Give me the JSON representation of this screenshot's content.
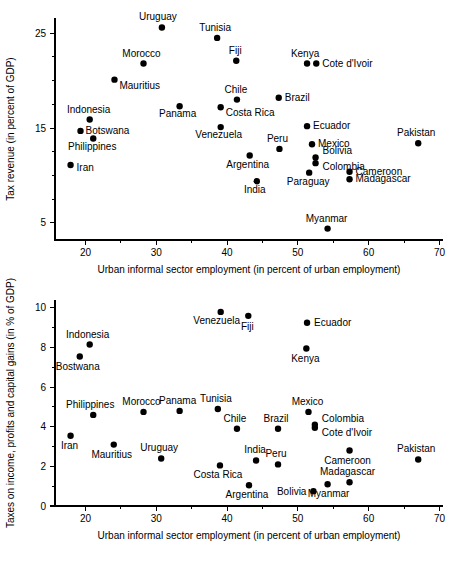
{
  "figure": {
    "background": "#ffffff",
    "ink": "#000000"
  },
  "chart_data": [
    {
      "id": "top",
      "type": "scatter",
      "title": "",
      "xlabel": "Urban informal sector employment (in percent of urban employment)",
      "ylabel": "Tax revenue (in percent of GDP)",
      "xlim": [
        15.7,
        70.5
      ],
      "ylim": [
        3.2,
        26.6
      ],
      "xticks": [
        20,
        30,
        40,
        50,
        60,
        70
      ],
      "xtick_labels": [
        "20",
        "30",
        "40",
        "50",
        "60",
        "70"
      ],
      "xminor_step": 5,
      "yticks": [
        5,
        15,
        25
      ],
      "ytick_labels": [
        "5",
        "15",
        "25"
      ],
      "yminor_step": 2.5,
      "grid": false,
      "legend": "none",
      "marker": "filled-circle",
      "points": [
        {
          "name": "Uruguay",
          "x": 30.8,
          "y": 25.6,
          "lx": -4,
          "ly": -7,
          "anchor": "middle"
        },
        {
          "name": "Tunisia",
          "x": 38.6,
          "y": 24.5,
          "lx": -2,
          "ly": -7,
          "anchor": "middle"
        },
        {
          "name": "Morocco",
          "x": 28.2,
          "y": 21.8,
          "lx": -2,
          "ly": -7,
          "anchor": "middle"
        },
        {
          "name": "Fiji",
          "x": 41.3,
          "y": 22.1,
          "lx": -1,
          "ly": -7,
          "anchor": "middle"
        },
        {
          "name": "Kenya",
          "x": 51.3,
          "y": 21.8,
          "lx": -2,
          "ly": -7,
          "anchor": "middle"
        },
        {
          "name": "Cote d'Ivoir",
          "x": 52.6,
          "y": 21.8,
          "lx": 6,
          "ly": 3,
          "anchor": "start"
        },
        {
          "name": "Mauritius",
          "x": 24.1,
          "y": 20.1,
          "lx": 5,
          "ly": 9,
          "anchor": "start"
        },
        {
          "name": "Chile",
          "x": 41.4,
          "y": 18.0,
          "lx": -1,
          "ly": -7,
          "anchor": "middle"
        },
        {
          "name": "Brazil",
          "x": 47.3,
          "y": 18.2,
          "lx": 6,
          "ly": 3,
          "anchor": "start"
        },
        {
          "name": "Costa Rica",
          "x": 39.1,
          "y": 17.2,
          "lx": 5,
          "ly": 9,
          "anchor": "start"
        },
        {
          "name": "Panama",
          "x": 33.3,
          "y": 17.3,
          "lx": -2,
          "ly": 11,
          "anchor": "middle"
        },
        {
          "name": "Indonesia",
          "x": 20.6,
          "y": 15.9,
          "lx": -1,
          "ly": -7,
          "anchor": "middle"
        },
        {
          "name": "Ecuador",
          "x": 51.3,
          "y": 15.2,
          "lx": 6,
          "ly": 3,
          "anchor": "start"
        },
        {
          "name": "Venezuela",
          "x": 39.1,
          "y": 15.1,
          "lx": -2,
          "ly": 11,
          "anchor": "middle"
        },
        {
          "name": "Botswana",
          "x": 19.3,
          "y": 14.7,
          "lx": 5,
          "ly": 3,
          "anchor": "start"
        },
        {
          "name": "Pakistan",
          "x": 67.0,
          "y": 13.4,
          "lx": -2,
          "ly": -7,
          "anchor": "middle"
        },
        {
          "name": "Philippines",
          "x": 21.1,
          "y": 13.9,
          "lx": -1,
          "ly": 12,
          "anchor": "middle"
        },
        {
          "name": "Mexico",
          "x": 52.0,
          "y": 13.3,
          "lx": 6,
          "ly": 3,
          "anchor": "start"
        },
        {
          "name": "Peru",
          "x": 47.4,
          "y": 12.8,
          "lx": -2,
          "ly": -7,
          "anchor": "middle"
        },
        {
          "name": "Bolivia",
          "x": 52.5,
          "y": 11.9,
          "lx": 7,
          "ly": -3,
          "anchor": "start"
        },
        {
          "name": "Colombia",
          "x": 52.5,
          "y": 11.3,
          "lx": 7,
          "ly": 7,
          "anchor": "start"
        },
        {
          "name": "Argentina",
          "x": 43.2,
          "y": 12.1,
          "lx": -2,
          "ly": 12,
          "anchor": "middle"
        },
        {
          "name": "Iran",
          "x": 17.9,
          "y": 11.1,
          "lx": 6,
          "ly": 6,
          "anchor": "start"
        },
        {
          "name": "Cameroon",
          "x": 57.3,
          "y": 10.4,
          "lx": 6,
          "ly": 3,
          "anchor": "start"
        },
        {
          "name": "Paraguay",
          "x": 51.6,
          "y": 10.3,
          "lx": -1,
          "ly": 12,
          "anchor": "middle"
        },
        {
          "name": "Madagascar",
          "x": 57.3,
          "y": 9.6,
          "lx": 6,
          "ly": 3,
          "anchor": "start"
        },
        {
          "name": "India",
          "x": 44.2,
          "y": 9.4,
          "lx": -2,
          "ly": 12,
          "anchor": "middle"
        },
        {
          "name": "Myanmar",
          "x": 54.2,
          "y": 4.4,
          "lx": -1,
          "ly": -7,
          "anchor": "middle"
        }
      ]
    },
    {
      "id": "bottom",
      "type": "scatter",
      "title": "",
      "xlabel": "Urban informal sector employment (in percent of urban employment)",
      "ylabel": "Taxes on income, profits and capital gains (in % of GDP)",
      "xlim": [
        15.7,
        70.5
      ],
      "ylim": [
        0,
        10.4
      ],
      "xticks": [
        20,
        30,
        40,
        50,
        60,
        70
      ],
      "xtick_labels": [
        "20",
        "30",
        "40",
        "50",
        "60",
        "70"
      ],
      "xminor_step": 5,
      "yticks": [
        0,
        2,
        4,
        6,
        8,
        10
      ],
      "ytick_labels": [
        "0",
        "2",
        "4",
        "6",
        "8",
        "10"
      ],
      "yminor_step": 1,
      "grid": false,
      "legend": "none",
      "marker": "filled-circle",
      "points": [
        {
          "name": "Venezuela",
          "x": 39.1,
          "y": 9.8,
          "lx": -4,
          "ly": 12,
          "anchor": "middle"
        },
        {
          "name": "Fiji",
          "x": 43.0,
          "y": 9.6,
          "lx": -1,
          "ly": 14,
          "anchor": "middle"
        },
        {
          "name": "Ecuador",
          "x": 51.3,
          "y": 9.25,
          "lx": 7,
          "ly": 3,
          "anchor": "start"
        },
        {
          "name": "Indonesia",
          "x": 20.6,
          "y": 8.15,
          "lx": -2,
          "ly": -7,
          "anchor": "middle"
        },
        {
          "name": "Kenya",
          "x": 51.2,
          "y": 7.95,
          "lx": -1,
          "ly": 13,
          "anchor": "middle"
        },
        {
          "name": "Bostwana",
          "x": 19.2,
          "y": 7.55,
          "lx": -2,
          "ly": 14,
          "anchor": "middle"
        },
        {
          "name": "Tunisia",
          "x": 38.7,
          "y": 4.9,
          "lx": -2,
          "ly": -7,
          "anchor": "middle"
        },
        {
          "name": "Panama",
          "x": 33.3,
          "y": 4.8,
          "lx": -2,
          "ly": -7,
          "anchor": "middle"
        },
        {
          "name": "Morocco",
          "x": 28.2,
          "y": 4.75,
          "lx": -2,
          "ly": -7,
          "anchor": "middle"
        },
        {
          "name": "Mexico",
          "x": 51.5,
          "y": 4.75,
          "lx": -1,
          "ly": -7,
          "anchor": "middle"
        },
        {
          "name": "Philippines",
          "x": 21.1,
          "y": 4.6,
          "lx": -3,
          "ly": -7,
          "anchor": "middle"
        },
        {
          "name": "Colombia",
          "x": 52.4,
          "y": 4.1,
          "lx": 7,
          "ly": -3,
          "anchor": "start"
        },
        {
          "name": "Cote d'Ivoir",
          "x": 52.4,
          "y": 3.95,
          "lx": 7,
          "ly": 8,
          "anchor": "start"
        },
        {
          "name": "Chile",
          "x": 41.4,
          "y": 3.9,
          "lx": -2,
          "ly": -7,
          "anchor": "middle"
        },
        {
          "name": "Brazil",
          "x": 47.2,
          "y": 3.9,
          "lx": -2,
          "ly": -7,
          "anchor": "middle"
        },
        {
          "name": "Iran",
          "x": 17.9,
          "y": 3.55,
          "lx": -1,
          "ly": 13,
          "anchor": "middle"
        },
        {
          "name": "Mauritius",
          "x": 24.0,
          "y": 3.1,
          "lx": -2,
          "ly": 13,
          "anchor": "middle"
        },
        {
          "name": "Cameroon",
          "x": 57.3,
          "y": 2.8,
          "lx": -2,
          "ly": 13,
          "anchor": "middle"
        },
        {
          "name": "India",
          "x": 44.1,
          "y": 2.3,
          "lx": -1,
          "ly": -7,
          "anchor": "middle"
        },
        {
          "name": "Pakistan",
          "x": 67.0,
          "y": 2.35,
          "lx": -2,
          "ly": -7,
          "anchor": "middle"
        },
        {
          "name": "Uruguay",
          "x": 30.7,
          "y": 2.4,
          "lx": -2,
          "ly": -7,
          "anchor": "middle"
        },
        {
          "name": "Peru",
          "x": 47.2,
          "y": 2.1,
          "lx": -2,
          "ly": -7,
          "anchor": "middle"
        },
        {
          "name": "Costa Rica",
          "x": 39.0,
          "y": 2.05,
          "lx": -2,
          "ly": 13,
          "anchor": "middle"
        },
        {
          "name": "Madagascar",
          "x": 57.3,
          "y": 1.2,
          "lx": -2,
          "ly": -7,
          "anchor": "middle"
        },
        {
          "name": "Myanmar",
          "x": 54.2,
          "y": 1.1,
          "lx": 1,
          "ly": 13,
          "anchor": "middle"
        },
        {
          "name": "Argentina",
          "x": 43.1,
          "y": 1.05,
          "lx": -2,
          "ly": 13,
          "anchor": "middle"
        },
        {
          "name": "Bolivia",
          "x": 52.2,
          "y": 0.75,
          "lx": -7,
          "ly": 4,
          "anchor": "end"
        }
      ]
    }
  ]
}
